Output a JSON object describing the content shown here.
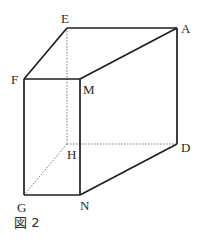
{
  "figure": {
    "caption": "図 2",
    "vertices": {
      "E": {
        "label": "E",
        "x": 67,
        "y": 28
      },
      "A": {
        "label": "A",
        "x": 177,
        "y": 28
      },
      "F": {
        "label": "F",
        "x": 24,
        "y": 79
      },
      "M": {
        "label": "M",
        "x": 80,
        "y": 79
      },
      "H": {
        "label": "H",
        "x": 67,
        "y": 144
      },
      "D": {
        "label": "D",
        "x": 177,
        "y": 144
      },
      "G": {
        "label": "G",
        "x": 24,
        "y": 195
      },
      "N": {
        "label": "N",
        "x": 80,
        "y": 195
      }
    },
    "solid_edges": [
      "EA",
      "EF",
      "FM",
      "MA",
      "AD",
      "FG",
      "MN",
      "GN",
      "ND"
    ],
    "hidden_edges": [
      "EH",
      "HD",
      "HG"
    ]
  }
}
